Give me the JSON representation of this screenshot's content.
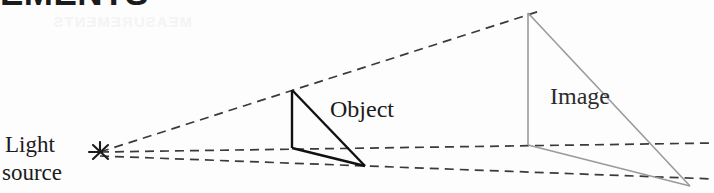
{
  "figure": {
    "title_fragment": "EMENTS",
    "ghost_bleed_text": "MEASUREMENTS",
    "background_color": "#fdfdfd",
    "type": "shadow-projection-diagram"
  },
  "labels": {
    "light_source_line1": "Light",
    "light_source_line2": "source",
    "object": "Object",
    "image": "Image"
  },
  "colors": {
    "ink_black": "#1b1b1b",
    "object_stroke": "#111111",
    "image_stroke": "#9a9a9a",
    "ray_dashed": "#3a3a3a",
    "image_label_color": "#2b2b2b",
    "ghost": "#f4f4f4"
  },
  "geometry": {
    "light_source_point": [
      100,
      152
    ],
    "object_apex": [
      292,
      90
    ],
    "object_base_front": [
      292,
      148
    ],
    "object_base_right": [
      365,
      166
    ],
    "image_apex": [
      528,
      13
    ],
    "image_base_front": [
      528,
      145
    ],
    "image_base_right": [
      690,
      186
    ],
    "ray_upper_end": [
      540,
      11
    ],
    "ray_middle_end": [
      714,
      143
    ],
    "ray_lower_end": [
      714,
      178
    ]
  },
  "strokes": {
    "dash_pattern": "9 6",
    "ray_width": 1.7,
    "object_width": 2.4,
    "image_width": 1.6
  }
}
